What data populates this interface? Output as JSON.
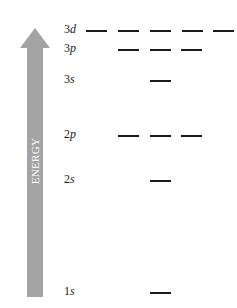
{
  "axis": {
    "label": "ENERGY",
    "color": "#a3a3a3"
  },
  "levels": [
    {
      "n": "3",
      "l": "d",
      "y": 30,
      "orbitals_x": [
        86,
        118,
        150,
        182,
        213
      ]
    },
    {
      "n": "3",
      "l": "p",
      "y": 49,
      "orbitals_x": [
        118,
        150,
        181
      ]
    },
    {
      "n": "3",
      "l": "s",
      "y": 80,
      "orbitals_x": [
        150
      ]
    },
    {
      "n": "2",
      "l": "p",
      "y": 135,
      "orbitals_x": [
        118,
        150,
        181
      ]
    },
    {
      "n": "2",
      "l": "s",
      "y": 180,
      "orbitals_x": [
        150
      ]
    },
    {
      "n": "1",
      "l": "s",
      "y": 292,
      "orbitals_x": [
        150
      ]
    }
  ]
}
